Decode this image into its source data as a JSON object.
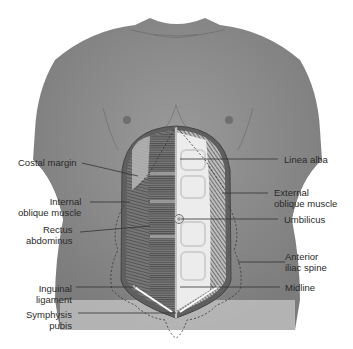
{
  "diagram": {
    "labels_left": [
      {
        "id": "costal-margin",
        "line1": "Costal margin",
        "line2": ""
      },
      {
        "id": "internal-oblique",
        "line1": "Internal",
        "line2": "oblique muscle"
      },
      {
        "id": "rectus-abdominus",
        "line1": "Rectus",
        "line2": "abdominus"
      },
      {
        "id": "inguinal-ligament",
        "line1": "Inguinal",
        "line2": "ligament"
      },
      {
        "id": "symphysis-pubis",
        "line1": "Symphysis",
        "line2": "pubis"
      }
    ],
    "labels_right": [
      {
        "id": "linea-alba",
        "line1": "Linea alba",
        "line2": ""
      },
      {
        "id": "external-oblique",
        "line1": "External",
        "line2": "oblique muscle"
      },
      {
        "id": "umbilicus",
        "line1": "Umbilicus",
        "line2": ""
      },
      {
        "id": "anterior-iliac-spine",
        "line1": "Anterior",
        "line2": "iliac spine"
      },
      {
        "id": "midline",
        "line1": "Midline",
        "line2": ""
      }
    ],
    "colors": {
      "skin": "#8e8e8e",
      "skin_light": "#b5b5b5",
      "muscle_dark": "#6a6a6a",
      "fascia": "#e8e8e8",
      "leader_line": "#333333"
    }
  }
}
